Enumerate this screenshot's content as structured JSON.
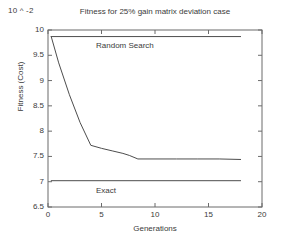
{
  "chart_data": {
    "type": "line",
    "title": "Fitness for 25% gain matrix deviation case",
    "xlabel": "Generations",
    "ylabel": "Fitness (Cost)",
    "y_exponent_label": "10 ^ -2",
    "xlim": [
      0,
      20
    ],
    "ylim": [
      6.5,
      10
    ],
    "xticks": [
      0,
      5,
      10,
      15,
      20
    ],
    "xtick_labels": [
      "0",
      "5",
      "10",
      "15",
      "20"
    ],
    "yticks": [
      6.5,
      7,
      7.5,
      8,
      8.5,
      9,
      9.5,
      10
    ],
    "ytick_labels": [
      "6.5",
      "7",
      "7.5",
      "8",
      "8.5",
      "9",
      "9.5",
      "10"
    ],
    "grid": false,
    "legend_position": "inline-annotations",
    "line_color": "#4d4d4d",
    "axis_color": "#6b6b6b",
    "background": "#ffffff",
    "series": [
      {
        "name": "Genetic Algorithm",
        "annotation": "",
        "x": [
          0.3,
          1.0,
          2.0,
          3.0,
          4.0,
          5.0,
          6.0,
          7.0,
          7.6,
          8.4,
          10.0,
          12.0,
          14.0,
          16.0,
          18.0
        ],
        "values": [
          9.87,
          9.35,
          8.72,
          8.17,
          7.72,
          7.66,
          7.61,
          7.56,
          7.52,
          7.45,
          7.45,
          7.45,
          7.45,
          7.45,
          7.44
        ]
      },
      {
        "name": "Random Search",
        "annotation": "Random Search",
        "x": [
          0.3,
          18.0
        ],
        "values": [
          9.87,
          9.87
        ]
      },
      {
        "name": "Exact",
        "annotation": "Exact",
        "x": [
          0.3,
          18.0
        ],
        "values": [
          7.02,
          7.02
        ]
      }
    ]
  }
}
